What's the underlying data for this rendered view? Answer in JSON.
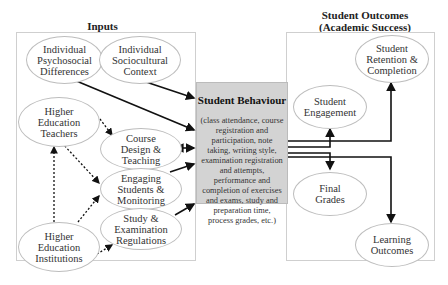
{
  "inputs": {
    "title": "Inputs",
    "nodes": {
      "psychosocial": "Individual\nPsychosocial\nDifferences",
      "sociocultural": "Individual\nSociocultural\nContext",
      "teachers": "Higher\nEducation\nTeachers",
      "course_design": "Course\nDesign &\nTeaching",
      "engaging": "Engaging\nStudents &\nMonitoring",
      "regulations": "Study &\nExamination\nRegulations",
      "institutions": "Higher\nEducation\nInstitutions"
    }
  },
  "behaviour": {
    "title": "Student Behaviour",
    "description": "(class attendance, course registration and participation, note taking, writing style, examination registration and attempts, performance and completion of exercises and exams, study and preparation time, process grades, etc.)"
  },
  "outcomes": {
    "title": "Student Outcomes\n(Academic Success)",
    "title_line1": "Student Outcomes",
    "title_line2": "(Academic Success)",
    "nodes": {
      "retention": "Student\nRetention &\nCompletion",
      "engagement": "Student\nEngagement",
      "grades": "Final\nGrades",
      "learning": "Learning\nOutcomes"
    }
  },
  "legend": {
    "solid_arrow": "direct influence",
    "dotted_arrow": "indirect influence"
  }
}
